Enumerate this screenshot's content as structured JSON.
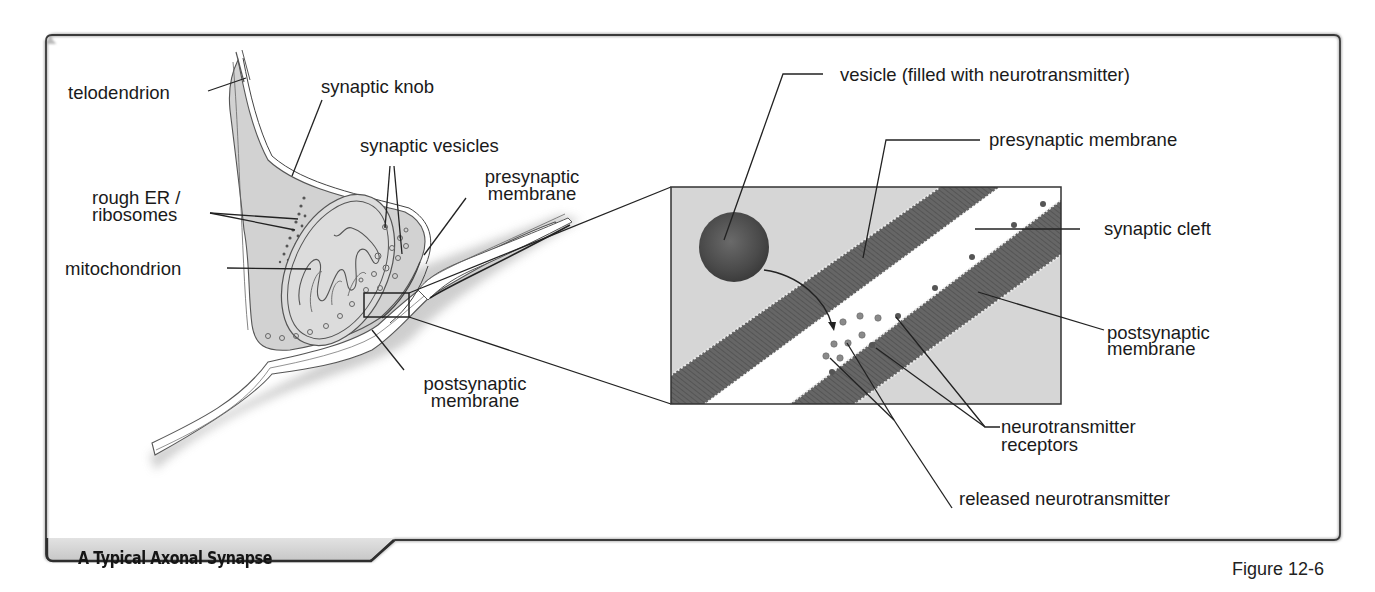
{
  "figure": {
    "title": "A Typical Axonal Synapse",
    "figure_number": "Figure 12-6"
  },
  "left_panel": {
    "labels": {
      "telodendrion": "telodendrion",
      "synaptic_knob": "synaptic knob",
      "synaptic_vesicles": "synaptic vesicles",
      "rough_er_line1": "rough ER /",
      "rough_er_line2": "ribosomes",
      "mitochondrion": "mitochondrion",
      "presynaptic_membrane_line1": "presynaptic",
      "presynaptic_membrane_line2": "membrane",
      "postsynaptic_membrane_line1": "postsynaptic",
      "postsynaptic_membrane_line2": "membrane"
    }
  },
  "inset_panel": {
    "labels": {
      "vesicle": "vesicle (filled with neurotransmitter)",
      "presynaptic_membrane": "presynaptic membrane",
      "synaptic_cleft": "synaptic cleft",
      "postsynaptic_membrane_line1": "postsynaptic",
      "postsynaptic_membrane_line2": "membrane",
      "receptors_line1": "neurotransmitter",
      "receptors_line2": "receptors",
      "released_neurotransmitter": "released neurotransmitter"
    }
  },
  "colors": {
    "frame": "#3a3a3a",
    "tab_fill": "#d4d4d4",
    "cell_fill": "#d3d3d3",
    "membrane_dark": "#5e5e5e",
    "inset_bg": "#d6d6d6",
    "cleft": "#ffffff"
  }
}
